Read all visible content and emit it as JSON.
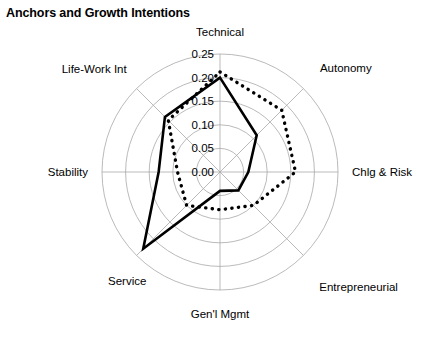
{
  "chart_data": {
    "type": "radar",
    "title": "Anchors and Growth Intentions",
    "categories": [
      "Technical",
      "Autonomy",
      "Chlg & Risk",
      "Entrepreneurial",
      "Gen'l Mgmt",
      "Service",
      "Stability",
      "Life-Work Int"
    ],
    "tick_labels": [
      "0.00",
      "0.05",
      "0.10",
      "0.15",
      "0.20",
      "0.25"
    ],
    "tick_values": [
      0.0,
      0.05,
      0.1,
      0.15,
      0.2,
      0.25
    ],
    "rlim": [
      0.0,
      0.25
    ],
    "grid": true,
    "legend": "none",
    "xlabel": "",
    "ylabel": "",
    "series": [
      {
        "name": "solid",
        "style": "solid",
        "color": "#000000",
        "values": [
          0.2,
          0.11,
          0.06,
          0.055,
          0.04,
          0.23,
          0.13,
          0.165
        ]
      },
      {
        "name": "dotted",
        "style": "dotted",
        "color": "#000000",
        "values": [
          0.212,
          0.185,
          0.16,
          0.1,
          0.08,
          0.1,
          0.09,
          0.155
        ]
      }
    ]
  },
  "geometry": {
    "center_x": 220,
    "center_y": 172,
    "radius": 118,
    "start_angle_deg": -90,
    "direction": "clockwise"
  },
  "axis_label_text": {
    "technical": "Technical",
    "autonomy": "Autonomy",
    "chlg_risk": "Chlg & Risk",
    "entrepreneurial": "Entrepreneurial",
    "genl_mgmt": "Gen'l Mgmt",
    "service": "Service",
    "stability": "Stability",
    "life_work_int": "Life-Work Int"
  }
}
